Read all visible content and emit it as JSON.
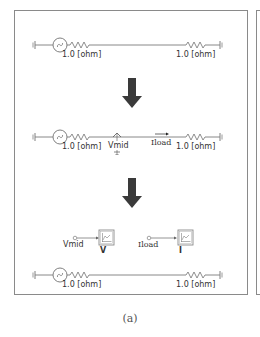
{
  "figure": {
    "caption": "(a)",
    "colors": {
      "wire": "#7a7a7a",
      "component": "#808080",
      "arrow": "#3a3a3a",
      "frame_border": "#8a8a8a",
      "text": "#333333"
    }
  },
  "stages": [
    {
      "id": "stage-1-original-circuit",
      "resistor_left_label": "1.0 [ohm]",
      "resistor_right_label": "1.0 [ohm]"
    },
    {
      "id": "stage-2-with-measurements",
      "resistor_left_label": "1.0 [ohm]",
      "resistor_right_label": "1.0 [ohm]",
      "voltage_probe_label": "Vmid",
      "current_probe_label": "Iload"
    },
    {
      "id": "stage-3-meters-and-circuit",
      "meters": [
        {
          "signal_label": "Vmid",
          "meter_label": "V"
        },
        {
          "signal_label": "Iload",
          "meter_label": "I"
        }
      ],
      "resistor_left_label": "1.0 [ohm]",
      "resistor_right_label": "1.0 [ohm]"
    }
  ],
  "arrows": [
    {
      "direction": "down"
    },
    {
      "direction": "down"
    }
  ]
}
